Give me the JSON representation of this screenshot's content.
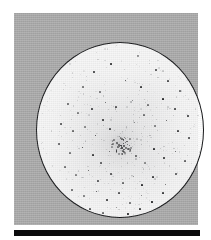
{
  "figure": {
    "caption": "",
    "panel_label": "",
    "background_color": "#adadad",
    "field_color": "#fdfdfd",
    "field_outline_color": "#17181a",
    "point_color": "#2b2c2e",
    "scale_bar_color": "#0b0b0c"
  },
  "chart_data": {
    "type": "scatter",
    "title": "",
    "subtitle": "",
    "xlabel": "",
    "ylabel": "",
    "grid": false,
    "legend_position": "none",
    "xlim": [
      0,
      168
    ],
    "ylim": [
      0,
      176
    ],
    "annotations": [],
    "tick_labels": {
      "x": [],
      "y": []
    },
    "field_of_view": {
      "shape": "circle",
      "center": [
        84,
        88
      ],
      "radius_x": 84,
      "radius_y": 88,
      "outline_width_px": 1.2
    },
    "cluster_core": {
      "name": "central concentration",
      "center": [
        85,
        102
      ],
      "extent": [
        22,
        20
      ],
      "point_count": 46
    },
    "series": [
      {
        "name": "point sources",
        "marker": "dot",
        "points": [
          [
            101,
            13,
            1.3
          ],
          [
            74,
            21,
            1.2
          ],
          [
            57,
            29,
            1.1
          ],
          [
            119,
            27,
            1.2
          ],
          [
            46,
            44,
            1.3
          ],
          [
            63,
            49,
            1.1
          ],
          [
            88,
            37,
            1.0
          ],
          [
            104,
            44,
            1.2
          ],
          [
            131,
            38,
            1.1
          ],
          [
            143,
            48,
            1.3
          ],
          [
            31,
            61,
            1.2
          ],
          [
            41,
            70,
            1.1
          ],
          [
            55,
            66,
            1.4
          ],
          [
            68,
            59,
            1.0
          ],
          [
            79,
            64,
            1.1
          ],
          [
            95,
            57,
            1.0
          ],
          [
            111,
            62,
            1.2
          ],
          [
            126,
            56,
            1.1
          ],
          [
            138,
            66,
            1.3
          ],
          [
            151,
            73,
            1.1
          ],
          [
            24,
            81,
            1.2
          ],
          [
            36,
            88,
            1.1
          ],
          [
            48,
            84,
            1.3
          ],
          [
            58,
            92,
            1.0
          ],
          [
            66,
            77,
            1.1
          ],
          [
            73,
            86,
            1.2
          ],
          [
            97,
            79,
            1.0
          ],
          [
            107,
            72,
            1.1
          ],
          [
            118,
            83,
            1.2
          ],
          [
            129,
            77,
            1.0
          ],
          [
            141,
            88,
            1.2
          ],
          [
            152,
            95,
            1.1
          ],
          [
            22,
            101,
            1.1
          ],
          [
            33,
            110,
            1.2
          ],
          [
            45,
            104,
            1.0
          ],
          [
            56,
            112,
            1.1
          ],
          [
            64,
            120,
            1.3
          ],
          [
            72,
            108,
            1.0
          ],
          [
            99,
            113,
            1.1
          ],
          [
            108,
            120,
            1.4
          ],
          [
            117,
            106,
            1.1
          ],
          [
            127,
            115,
            1.2
          ],
          [
            138,
            108,
            1.0
          ],
          [
            148,
            118,
            1.2
          ],
          [
            28,
            124,
            1.1
          ],
          [
            39,
            132,
            1.2
          ],
          [
            51,
            127,
            1.0
          ],
          [
            61,
            138,
            1.3
          ],
          [
            74,
            131,
            1.1
          ],
          [
            86,
            140,
            1.2
          ],
          [
            96,
            133,
            1.0
          ],
          [
            105,
            142,
            1.1
          ],
          [
            116,
            134,
            1.2
          ],
          [
            128,
            141,
            1.0
          ],
          [
            139,
            131,
            1.1
          ],
          [
            35,
            147,
            1.2
          ],
          [
            47,
            153,
            1.1
          ],
          [
            59,
            148,
            1.0
          ],
          [
            70,
            157,
            1.2
          ],
          [
            82,
            150,
            1.1
          ],
          [
            93,
            160,
            1.3
          ],
          [
            104,
            152,
            1.0
          ],
          [
            115,
            159,
            1.1
          ],
          [
            126,
            150,
            1.2
          ],
          [
            136,
            157,
            1.0
          ],
          [
            53,
            166,
            1.1
          ],
          [
            66,
            170,
            1.2
          ],
          [
            79,
            164,
            1.0
          ],
          [
            91,
            171,
            1.1
          ],
          [
            103,
            166,
            1.2
          ],
          [
            114,
            172,
            1.0
          ],
          [
            124,
            164,
            1.1
          ],
          [
            70,
            178,
            1.0
          ],
          [
            84,
            181,
            1.1
          ],
          [
            97,
            177,
            1.0
          ]
        ]
      }
    ]
  },
  "scale_bar": {
    "label": "",
    "length_px": 186
  }
}
